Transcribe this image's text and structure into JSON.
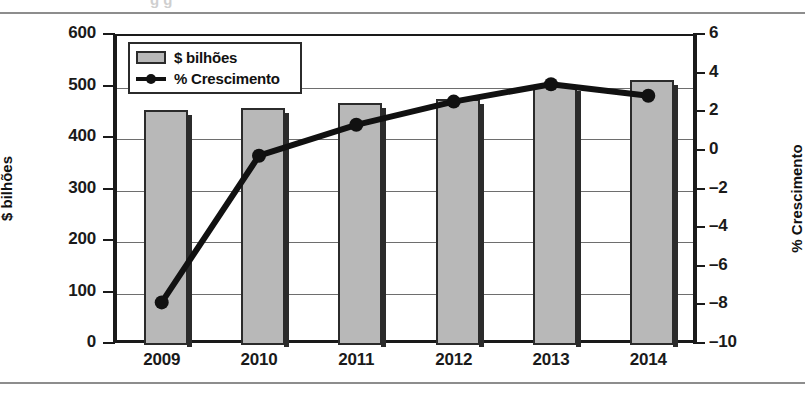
{
  "chart_data": {
    "type": "bar",
    "title": "",
    "categories": [
      "2009",
      "2010",
      "2011",
      "2012",
      "2013",
      "2014"
    ],
    "xlabel": "",
    "ylabel": "$ bilhões",
    "y2label": "% Crescimento",
    "ylim": [
      0,
      600
    ],
    "y2lim": [
      -10,
      6
    ],
    "yticks": [
      600,
      500,
      400,
      300,
      200,
      100,
      0
    ],
    "y2ticks": [
      6,
      4,
      2,
      0,
      -2,
      -4,
      -6,
      -8,
      -10
    ],
    "grid": true,
    "legend_position": "top-left",
    "series": [
      {
        "name": "$ bilhões",
        "type": "bar",
        "axis": "left",
        "color": "#b8b8b8",
        "values": [
          456,
          460,
          470,
          478,
          503,
          515
        ]
      },
      {
        "name": "% Crescimento",
        "type": "line",
        "axis": "right",
        "color": "#111111",
        "values": [
          -7.9,
          -0.3,
          1.3,
          2.5,
          3.4,
          2.8
        ]
      }
    ]
  },
  "legend": {
    "items": [
      {
        "label": "$ bilhões",
        "marker": "bar-swatch"
      },
      {
        "label": "% Crescimento",
        "marker": "line-dot"
      }
    ]
  },
  "axes": {
    "left_title": "$ bilhões",
    "right_title": "% Crescimento",
    "left_ticks": [
      "600",
      "500",
      "400",
      "300",
      "200",
      "100",
      "0"
    ],
    "right_ticks": [
      "6",
      "4",
      "2",
      "0",
      "–2",
      "–4",
      "–6",
      "–8",
      "–10"
    ],
    "x_ticks": [
      "2009",
      "2010",
      "2011",
      "2012",
      "2013",
      "2014"
    ]
  },
  "colors": {
    "bar_fill": "#b8b8b8",
    "bar_stroke": "#2b2b2b",
    "line": "#111111",
    "grid": "#6e6e6e",
    "axis": "#1a1a1a",
    "rule": "#8d8d8d"
  },
  "decor": {
    "clipped_heading": "g g"
  }
}
